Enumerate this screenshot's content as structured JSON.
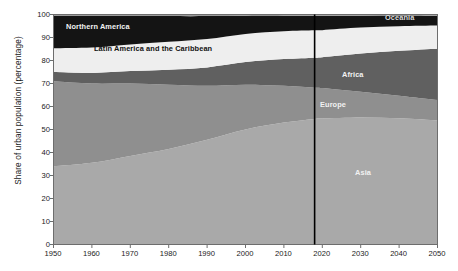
{
  "chart_data": {
    "type": "area",
    "stacked": true,
    "title": "",
    "xlabel": "",
    "ylabel": "Share of urban population (percentage)",
    "xlim": [
      1950,
      2050
    ],
    "ylim": [
      0,
      100
    ],
    "grid": false,
    "legend_position": "inline-annotations",
    "x": [
      1950,
      1960,
      1970,
      1980,
      1990,
      2000,
      2010,
      2018,
      2020,
      2030,
      2040,
      2050
    ],
    "xticks": [
      "1950",
      "1960",
      "1970",
      "1980",
      "1990",
      "2000",
      "2010",
      "2020",
      "2030",
      "2040",
      "2050"
    ],
    "yticks": [
      "0",
      "10",
      "20",
      "30",
      "40",
      "50",
      "60",
      "70",
      "80",
      "90",
      "100"
    ],
    "series": [
      {
        "name": "Asia",
        "color": "#a9a9a9",
        "label_color": "#f2f2f2",
        "values": [
          34.0,
          35.5,
          38.5,
          41.5,
          45.5,
          50.0,
          53.0,
          54.6,
          54.8,
          55.2,
          54.9,
          54.0
        ]
      },
      {
        "name": "Europe",
        "color": "#8f8f8f",
        "label_color": "#f2f2f2",
        "values": [
          37.0,
          34.5,
          31.5,
          28.0,
          23.5,
          19.5,
          16.0,
          13.6,
          13.2,
          11.2,
          9.8,
          8.8
        ]
      },
      {
        "name": "Africa",
        "color": "#606060",
        "label_color": "#f2f2f2",
        "values": [
          4.0,
          4.6,
          5.4,
          6.5,
          8.0,
          9.8,
          11.6,
          13.0,
          13.4,
          16.6,
          19.5,
          22.3
        ]
      },
      {
        "name": "Latin America and the Caribbean",
        "color": "#eeeeee",
        "label_color": "#111111",
        "values": [
          10.3,
          11.0,
          11.6,
          12.1,
          12.3,
          12.2,
          12.1,
          11.9,
          11.8,
          11.3,
          10.7,
          10.1
        ]
      },
      {
        "name": "Northern America",
        "color": "#141414",
        "label_color": "#f2f2f2",
        "values": [
          14.1,
          13.7,
          12.4,
          11.2,
          10.0,
          8.0,
          6.8,
          6.4,
          6.3,
          5.2,
          4.7,
          4.3
        ]
      },
      {
        "name": "Oceania",
        "color": "#9b9b9b",
        "label_color": "#d9d9d9",
        "values": [
          0.6,
          0.7,
          0.6,
          0.7,
          0.7,
          0.5,
          0.5,
          0.5,
          0.5,
          0.5,
          0.4,
          0.5
        ]
      }
    ],
    "reference_line": {
      "name": "year-2018-divider",
      "x": 2018,
      "color": "#000000",
      "label": ""
    },
    "annotations": [
      {
        "name": "Northern America",
        "x": 1962,
        "y": 93.0
      },
      {
        "name": "Latin America and the Caribbean",
        "x": 1975,
        "y": 81.0
      },
      {
        "name": "Africa",
        "x": 2032,
        "y": 77.0
      },
      {
        "name": "Europe",
        "x": 2026,
        "y": 62.5
      },
      {
        "name": "Asia",
        "x": 2032,
        "y": 31.0
      },
      {
        "name": "Oceania",
        "x": 2038,
        "y": 99.4
      }
    ]
  },
  "figure": {
    "background": "#ffffff",
    "plot_border_color": "#6d6d6d"
  }
}
